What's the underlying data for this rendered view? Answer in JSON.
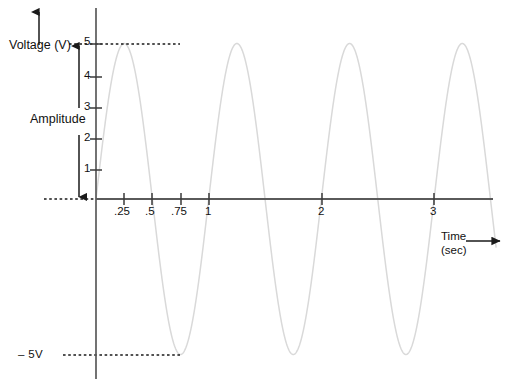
{
  "figure": {
    "background_color": "#ffffff",
    "wave_color": "#d9d9d9",
    "axis_color": "#555555",
    "text_color": "#111111"
  },
  "axes": {
    "y": {
      "label": "Voltage (V)",
      "ticks": [
        "1",
        "2",
        "3",
        "4",
        "5"
      ],
      "arrow": "up-arrow-icon"
    },
    "x": {
      "label_line1": "Time",
      "label_line2": "(sec)",
      "ticks": [
        ".25",
        ".5",
        ".75",
        "1",
        "2",
        "3"
      ],
      "arrow": "right-arrow-icon"
    }
  },
  "annotations": {
    "amplitude_label": "Amplitude",
    "negative_peak_label": "– 5V",
    "peak_guide_value": "5",
    "trough_guide_value": "-5"
  },
  "chart_data": {
    "type": "line",
    "xlabel": "Time (sec)",
    "ylabel": "Voltage (V)",
    "xlim": [
      0,
      3.55
    ],
    "ylim": [
      -5,
      5
    ],
    "xticks": [
      0.25,
      0.5,
      0.75,
      1,
      2,
      3
    ],
    "xticklabels": [
      ".25",
      ".5",
      ".75",
      "1",
      "2",
      "3"
    ],
    "yticks": [
      1,
      2,
      3,
      4,
      5
    ],
    "yticklabels": [
      "1",
      "2",
      "3",
      "4",
      "5"
    ],
    "grid": false,
    "legend": null,
    "series": [
      {
        "name": "voltage",
        "equation": "v(t) = 5 * sin(2*pi*t)",
        "amplitude": 5,
        "period": 1,
        "frequency": 1,
        "phase": 0,
        "peaks_at": [
          0.25,
          1.25,
          2.25,
          3.25
        ],
        "troughs_at": [
          0.75,
          1.75,
          2.75
        ],
        "zero_crossings": [
          0,
          0.5,
          1,
          1.5,
          2,
          2.5,
          3,
          3.5
        ]
      }
    ],
    "guides": [
      {
        "name": "peak-guide",
        "y": 5,
        "style": "dotted",
        "label": "5"
      },
      {
        "name": "zero-guide",
        "y": 0,
        "style": "dotted",
        "label": ""
      },
      {
        "name": "trough-guide",
        "y": -5,
        "style": "dotted",
        "label": "– 5V"
      }
    ],
    "annotations": [
      {
        "name": "amplitude-arrow",
        "text": "Amplitude",
        "from_y": 0,
        "to_y": 5
      },
      {
        "name": "voltage-axis-arrow",
        "text": "Voltage (V)"
      },
      {
        "name": "time-axis-arrow",
        "text": "Time (sec)"
      }
    ]
  }
}
